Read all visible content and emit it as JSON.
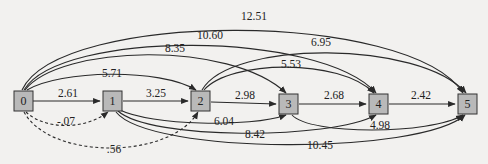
{
  "diagram": {
    "type": "directed network",
    "nodes": [
      {
        "id": "0",
        "label": "0",
        "x": 22,
        "y": 101
      },
      {
        "id": "1",
        "label": "1",
        "x": 112,
        "y": 101
      },
      {
        "id": "2",
        "label": "2",
        "x": 200,
        "y": 101
      },
      {
        "id": "3",
        "label": "3",
        "x": 288,
        "y": 104
      },
      {
        "id": "4",
        "label": "4",
        "x": 378,
        "y": 104
      },
      {
        "id": "5",
        "label": "5",
        "x": 467,
        "y": 104
      }
    ],
    "edges": [
      {
        "from": "0",
        "to": "1",
        "label": "2.61",
        "style": "solid"
      },
      {
        "from": "1",
        "to": "2",
        "label": "3.25",
        "style": "solid"
      },
      {
        "from": "2",
        "to": "3",
        "label": "2.98",
        "style": "solid"
      },
      {
        "from": "3",
        "to": "4",
        "label": "2.68",
        "style": "solid"
      },
      {
        "from": "4",
        "to": "5",
        "label": "2.42",
        "style": "solid"
      },
      {
        "from": "0",
        "to": "2",
        "label": "5.71",
        "style": "solid"
      },
      {
        "from": "0",
        "to": "3",
        "label": "8.35",
        "style": "solid"
      },
      {
        "from": "0",
        "to": "4",
        "label": "10.60",
        "style": "solid"
      },
      {
        "from": "0",
        "to": "5",
        "label": "12.51",
        "style": "solid"
      },
      {
        "from": "2",
        "to": "4",
        "label": "5.53",
        "style": "solid"
      },
      {
        "from": "2",
        "to": "5",
        "label": "6.95",
        "style": "solid"
      },
      {
        "from": "1",
        "to": "3",
        "label": "6.04",
        "style": "solid"
      },
      {
        "from": "1",
        "to": "4",
        "label": "8.42",
        "style": "solid"
      },
      {
        "from": "1",
        "to": "5",
        "label": "10.45",
        "style": "solid"
      },
      {
        "from": "3",
        "to": "5",
        "label": "4.98",
        "style": "solid"
      },
      {
        "from": "0",
        "to": "1",
        "label": "-.07",
        "style": "dashed"
      },
      {
        "from": "0",
        "to": "2",
        "label": ".56",
        "style": "dashed"
      }
    ]
  },
  "colors": {
    "background": "#f2f1ef",
    "node_fill": "#b9b9b9",
    "node_stroke": "#333333",
    "edge": "#2a2a2a"
  }
}
